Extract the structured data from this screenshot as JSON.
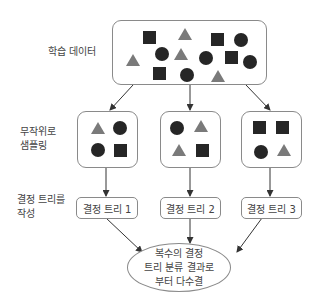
{
  "labels": {
    "training_data": "학습 데이터",
    "random_sampling": "무작위로\n샘플링",
    "build_trees": "결정 트리를\n작성"
  },
  "trees": [
    {
      "label": "결정 트리 1"
    },
    {
      "label": "결정 트리 2"
    },
    {
      "label": "결정 트리 3"
    }
  ],
  "result": {
    "label": "복수의 결정\n트리 분류 결과로\n부터 다수결"
  },
  "colors": {
    "dark_shape": "#262626",
    "triangle": "#7a7a7a",
    "border": "#8a8a8a",
    "arrow": "#333333"
  },
  "training_set_shapes": [
    {
      "type": "square",
      "x": 143,
      "y": 31
    },
    {
      "type": "triangle",
      "x": 178,
      "y": 28
    },
    {
      "type": "square",
      "x": 211,
      "y": 33
    },
    {
      "type": "circle",
      "x": 234,
      "y": 33
    },
    {
      "type": "circle",
      "x": 155,
      "y": 47
    },
    {
      "type": "triangle",
      "x": 174,
      "y": 48
    },
    {
      "type": "circle",
      "x": 199,
      "y": 51
    },
    {
      "type": "square",
      "x": 225,
      "y": 51
    },
    {
      "type": "circle",
      "x": 243,
      "y": 55
    },
    {
      "type": "triangle",
      "x": 126,
      "y": 54
    },
    {
      "type": "square",
      "x": 153,
      "y": 67
    },
    {
      "type": "circle",
      "x": 180,
      "y": 68
    },
    {
      "type": "triangle",
      "x": 211,
      "y": 70
    }
  ],
  "samples": [
    {
      "shapes": [
        {
          "type": "triangle"
        },
        {
          "type": "circle"
        },
        {
          "type": "circle"
        },
        {
          "type": "square"
        }
      ]
    },
    {
      "shapes": [
        {
          "type": "circle"
        },
        {
          "type": "triangle"
        },
        {
          "type": "triangle"
        },
        {
          "type": "square"
        }
      ]
    },
    {
      "shapes": [
        {
          "type": "square"
        },
        {
          "type": "square"
        },
        {
          "type": "circle"
        },
        {
          "type": "triangle"
        }
      ]
    }
  ]
}
